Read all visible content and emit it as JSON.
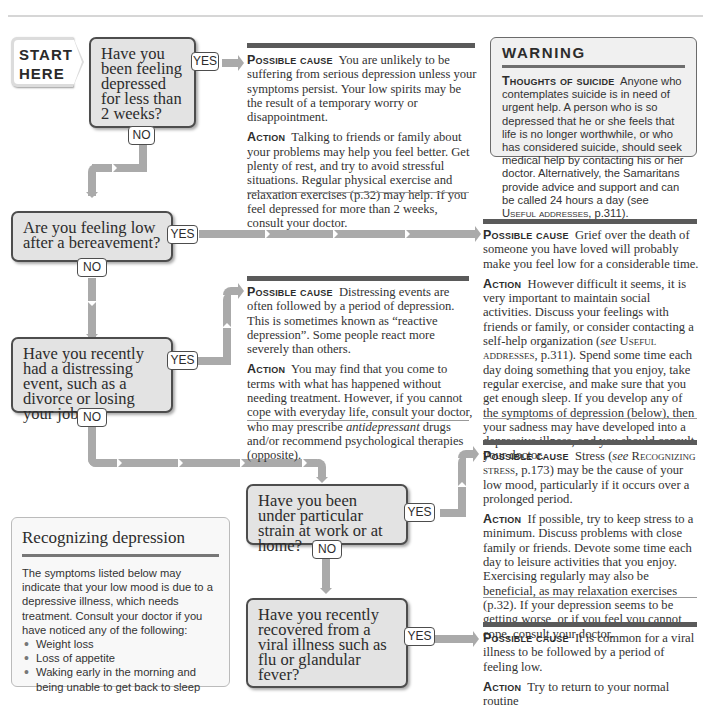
{
  "start": {
    "line1": "START",
    "line2": "HERE"
  },
  "labels": {
    "yes": "YES",
    "no": "NO",
    "possible_cause": "Possible cause",
    "action": "Action"
  },
  "questions": [
    {
      "id": "q1",
      "text": "Have you been feeling depressed for less than 2 weeks?"
    },
    {
      "id": "q2",
      "text": "Are you feeling low after a bereavement?"
    },
    {
      "id": "q3",
      "text": "Have you recently had a distressing event, such as a divorce or losing your job?"
    },
    {
      "id": "q4",
      "text": "Have you been under particular strain at work or at home?"
    },
    {
      "id": "q5",
      "text": "Have you recently recovered from a viral illness such as flu or glandular fever?"
    }
  ],
  "answers": {
    "a1": {
      "cause": "You are unlikely to be suffering from serious depression unless your symptoms persist. Your low spirits may be the result of a temporary worry or disappointment.",
      "action": "Talking to friends or family about your problems may help you feel better. Get plenty of rest, and try to avoid stressful situations. Regular physical exercise and relaxation exercises (p.32) may help. If you feel depressed for more than 2 weeks, consult your doctor."
    },
    "a2": {
      "cause": "Grief over the death of someone you have loved will probably make you feel low for a considerable time.",
      "action_pre": "However difficult it seems, it is very important to maintain social activities. Discuss your feelings with friends or family, or consider contacting a self-help organization (",
      "action_see": "see",
      "action_ref": "Useful addresses",
      "action_post": ", p.311). Spend some time each day doing something that you enjoy, take regular exercise, and make sure that you get enough sleep. If you develop any of the symptoms of depression (below), then your sadness may have developed into a depressive illness, and you should consult your doctor."
    },
    "a3": {
      "cause": "Distressing events are often followed by a period of depression. This is sometimes known as “reactive depression”. Some people react more severely than others.",
      "action_pre": "You may find that you come to terms with what has happened without needing treatment. However, if you cannot cope with everyday life, consult your doctor, who may prescribe ",
      "action_em": "antidepressant",
      "action_post": " drugs and/or recommend psychological therapies (opposite)."
    },
    "a4": {
      "cause_pre": "Stress (",
      "cause_see": "see",
      "cause_ref": "Recognizing stress",
      "cause_post": ", p.173) may be the cause of your low mood, particularly if it occurs over a prolonged period.",
      "action": "If possible, try to keep stress to a minimum. Discuss problems with close family or friends. Devote some time each day to leisure activities that you enjoy. Exercising regularly may also be beneficial, as may relaxation exercises (p.32). If your depression seems to be getting worse, or if you feel you cannot cope, consult your doctor."
    },
    "a5": {
      "cause": "It is common for a viral illness to be followed by a period of feeling low.",
      "action": "Try to return to your normal routine"
    }
  },
  "warning": {
    "title": "WARNING",
    "heading": "Thoughts of suicide",
    "body_pre": "Anyone who contemplates suicide is in need of urgent help. A person who is so depressed that he or she feels that life is no longer worthwhile, or who has considered suicide, should seek medical help by contacting his or her doctor. Alternatively, the Samaritans provide advice and support and can be called 24 hours a day (see ",
    "body_ref": "Useful addresses",
    "body_post": ", p.311)."
  },
  "recognizing": {
    "title": "Recognizing depression",
    "intro": "The symptoms listed below may indicate that your low mood is due to a depressive illness, which needs treatment. Consult your doctor if you have noticed any of the following:",
    "symptoms": [
      "Weight loss",
      "Loss of appetite",
      "Waking early in the morning and being unable to get back to sleep"
    ]
  }
}
